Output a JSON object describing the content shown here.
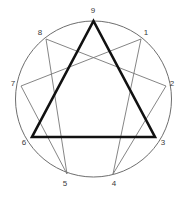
{
  "figure": {
    "name": "enneagram",
    "background_color": "#ffffff"
  },
  "chart_data": {
    "type": "diagram",
    "xlabel": "",
    "ylabel": "",
    "circle": {
      "cx": 93.5,
      "cy": 99,
      "r": 78,
      "stroke": "#6e6e6e",
      "stroke_width": 1
    },
    "points": [
      {
        "id": "1",
        "label": "1",
        "angle_deg": 40,
        "px": 141.0,
        "py": 39.0,
        "label_x": 146,
        "label_y": 33
      },
      {
        "id": "2",
        "label": "2",
        "angle_deg": 80,
        "px": 166.0,
        "py": 86.0,
        "label_x": 172,
        "label_y": 84
      },
      {
        "id": "3",
        "label": "3",
        "angle_deg": 120,
        "px": 155.0,
        "py": 137.0,
        "label_x": 163,
        "label_y": 143
      },
      {
        "id": "4",
        "label": "4",
        "angle_deg": 160,
        "px": 113.0,
        "py": 174.0,
        "label_x": 114,
        "label_y": 184
      },
      {
        "id": "5",
        "label": "5",
        "angle_deg": 200,
        "px": 67.0,
        "py": 174.0,
        "label_x": 65,
        "label_y": 184
      },
      {
        "id": "6",
        "label": "6",
        "angle_deg": 240,
        "px": 32.0,
        "py": 137.0,
        "label_x": 24,
        "label_y": 143
      },
      {
        "id": "7",
        "label": "7",
        "angle_deg": 280,
        "px": 21.0,
        "py": 86.0,
        "label_x": 13,
        "label_y": 84
      },
      {
        "id": "8",
        "label": "8",
        "angle_deg": 320,
        "px": 46.0,
        "py": 39.0,
        "label_x": 40,
        "label_y": 33
      },
      {
        "id": "9",
        "label": "9",
        "angle_deg": 0,
        "px": 93.5,
        "py": 21.0,
        "label_x": 93,
        "label_y": 11
      }
    ],
    "triangle": {
      "name": "inner-triangle",
      "sequence": [
        "9",
        "3",
        "6"
      ],
      "stroke": "#111111",
      "stroke_width": 2.6,
      "closed": true
    },
    "hexad": {
      "name": "hexad-path",
      "sequence": [
        "1",
        "4",
        "2",
        "8",
        "5",
        "7"
      ],
      "stroke": "#777777",
      "stroke_width": 0.9,
      "closed": true
    },
    "legend": {
      "show": false
    },
    "grid": false,
    "annotations": []
  }
}
